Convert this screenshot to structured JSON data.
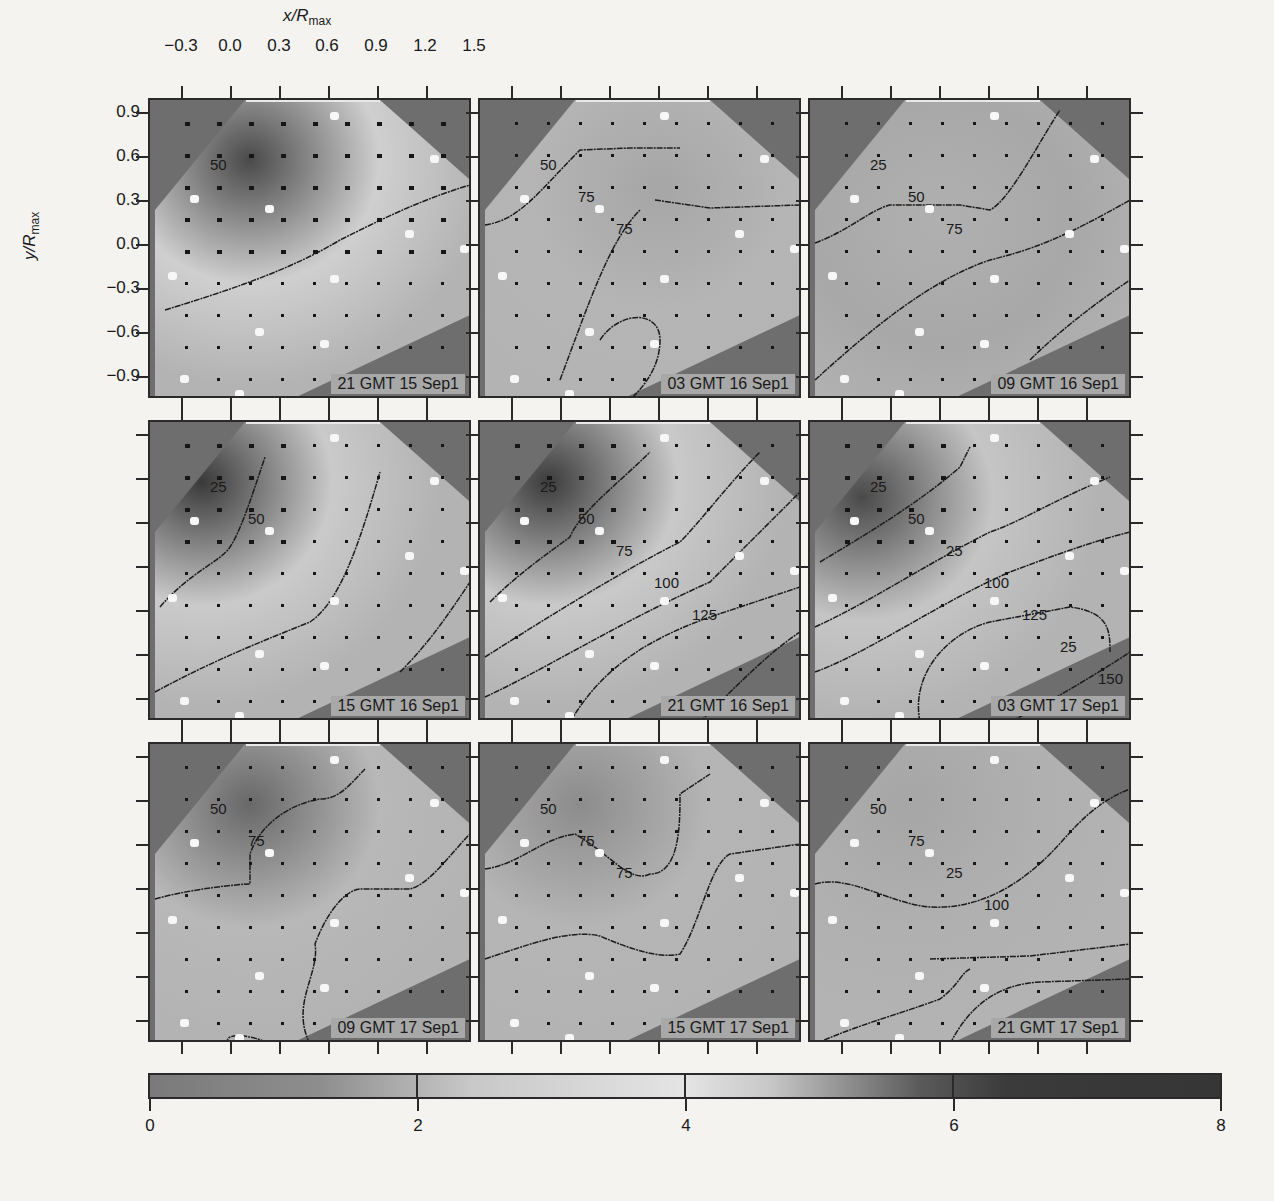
{
  "figure": {
    "x_axis_title": "x/R",
    "x_axis_sub": "max",
    "y_axis_title": "y/R",
    "y_axis_sub": "max",
    "x_ticks": [
      "−0.3",
      "0.0",
      "0.3",
      "0.6",
      "0.9",
      "1.2",
      "1.5"
    ],
    "y_ticks": [
      "0.9",
      "0.6",
      "0.3",
      "0.0",
      "−0.3",
      "−0.6",
      "−0.9"
    ],
    "panels": [
      {
        "label": "21 GMT 15 Sep1",
        "contours": [
          "50"
        ]
      },
      {
        "label": "03 GMT 16 Sep1",
        "contours": [
          "50",
          "75",
          "75"
        ]
      },
      {
        "label": "09 GMT 16 Sep1",
        "contours": [
          "25",
          "50",
          "75"
        ]
      },
      {
        "label": "15 GMT 16 Sep1",
        "contours": [
          "25",
          "50"
        ]
      },
      {
        "label": "21 GMT 16 Sep1",
        "contours": [
          "25",
          "50",
          "75",
          "100",
          "125"
        ]
      },
      {
        "label": "03 GMT 17 Sep1",
        "contours": [
          "25",
          "50",
          "25",
          "100",
          "125",
          "25",
          "150"
        ]
      },
      {
        "label": "09 GMT 17 Sep1",
        "contours": [
          "50",
          "75"
        ]
      },
      {
        "label": "15 GMT 17 Sep1",
        "contours": [
          "50",
          "75",
          "75"
        ]
      },
      {
        "label": "21 GMT 17 Sep1",
        "contours": [
          "50",
          "75",
          "25",
          "100"
        ]
      }
    ],
    "colorbar": {
      "ticks": [
        "0",
        "2",
        "4",
        "6",
        "8"
      ],
      "min": 0,
      "max": 8
    }
  },
  "chart_data": {
    "type": "heatmap",
    "title": "",
    "xlabel": "x/R_max",
    "ylabel": "y/R_max",
    "xlim": [
      -0.45,
      1.55
    ],
    "ylim": [
      -1.0,
      1.0
    ],
    "x_ticks": [
      -0.3,
      0.0,
      0.3,
      0.6,
      0.9,
      1.2,
      1.5
    ],
    "y_ticks": [
      0.9,
      0.6,
      0.3,
      0.0,
      -0.3,
      -0.6,
      -0.9
    ],
    "layout": "3x3 small multiples, shared axes",
    "colorbar": {
      "range": [
        0,
        8
      ],
      "ticks": [
        0,
        2,
        4,
        6,
        8
      ],
      "colormap": "gray: mid-gray at 0, light at 2-4, dark at 6-8"
    },
    "panels": [
      {
        "time": "21 GMT 15 Sep1",
        "contour_levels": [
          50
        ]
      },
      {
        "time": "03 GMT 16 Sep1",
        "contour_levels": [
          50,
          75,
          75
        ]
      },
      {
        "time": "09 GMT 16 Sep1",
        "contour_levels": [
          25,
          50,
          75
        ]
      },
      {
        "time": "15 GMT 16 Sep1",
        "contour_levels": [
          25,
          50
        ]
      },
      {
        "time": "21 GMT 16 Sep1",
        "contour_levels": [
          25,
          50,
          75,
          100,
          125
        ]
      },
      {
        "time": "03 GMT 17 Sep1",
        "contour_levels": [
          25,
          50,
          25,
          100,
          125,
          25,
          150
        ]
      },
      {
        "time": "09 GMT 17 Sep1",
        "contour_levels": [
          50,
          75
        ]
      },
      {
        "time": "15 GMT 17 Sep1",
        "contour_levels": [
          50,
          75,
          75
        ]
      },
      {
        "time": "21 GMT 17 Sep1",
        "contour_levels": [
          50,
          75,
          25,
          100
        ]
      }
    ]
  }
}
